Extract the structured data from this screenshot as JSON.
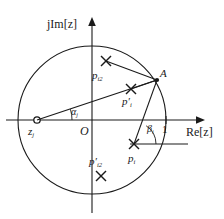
{
  "figure": {
    "type": "complex-plane-unit-circle-diagram",
    "axes": {
      "imaginary_label": "jIm[z]",
      "real_label": "Re[z]",
      "origin_label": "O",
      "unit_tick_label": "1"
    },
    "points": [
      {
        "id": "z_j",
        "symbol": "z",
        "sub": "j",
        "prime": false,
        "marker": "circle",
        "label_html": "z<sub>j</sub>"
      },
      {
        "id": "A",
        "symbol": "A",
        "sub": "",
        "prime": false,
        "marker": "dot",
        "label_html": "A"
      },
      {
        "id": "p_i2",
        "symbol": "p",
        "sub": "i2",
        "prime": false,
        "marker": "cross",
        "label_html": "p<sub>i2</sub>"
      },
      {
        "id": "pp_i",
        "symbol": "p",
        "sub": "i",
        "prime": true,
        "marker": "cross",
        "label_html": "p&prime;<sub>i</sub>"
      },
      {
        "id": "pp_i2",
        "symbol": "p",
        "sub": "i2",
        "prime": true,
        "marker": "cross",
        "label_html": "p&prime;<sub>i2</sub>"
      },
      {
        "id": "p_i",
        "symbol": "p",
        "sub": "i",
        "prime": false,
        "marker": "cross",
        "label_html": "p<sub>i</sub>"
      }
    ],
    "angles": [
      {
        "id": "alpha_j",
        "label_html": "&alpha;<sub>j</sub>",
        "vertex": "z_j"
      },
      {
        "id": "beta_i",
        "label_html": "&beta;<sub>i</sub>",
        "vertex": "p_i"
      }
    ],
    "colors": {
      "stroke": "#1a1a1a",
      "background": "#ffffff"
    },
    "geometry": {
      "origin": [
        92,
        120
      ],
      "radius": 74,
      "unit_tick_x": 166
    }
  }
}
